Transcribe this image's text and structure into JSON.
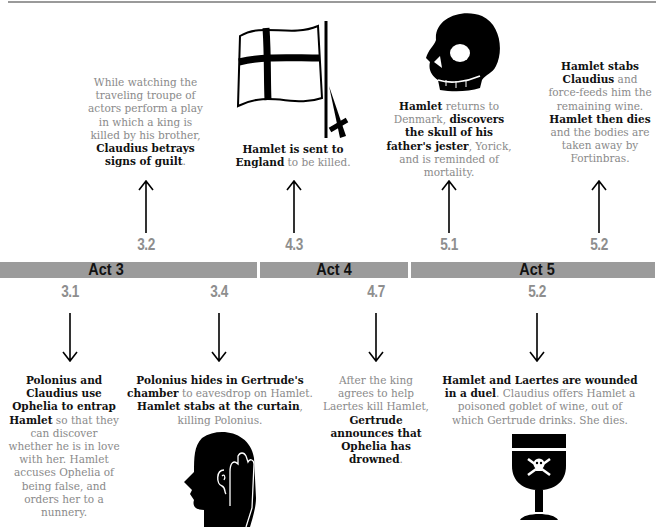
{
  "acts": [
    {
      "label": "Act 3"
    },
    {
      "label": "Act 4"
    },
    {
      "label": "Act 5"
    }
  ],
  "colors": {
    "bar": "#9b9b9b",
    "scene_label": "#8e8e8e",
    "text_regular": "#8a8a8a",
    "text_bold": "#111111"
  },
  "above_events": [
    {
      "scene": "3.2",
      "icon": "none",
      "parts": [
        {
          "t": "While watching the traveling troupe of actors perform a play in which a king is killed by his brother, ",
          "bold": false
        },
        {
          "t": "Claudius betrays signs of guilt",
          "bold": true
        },
        {
          "t": ".",
          "bold": false
        }
      ]
    },
    {
      "scene": "4.3",
      "icon": "flag-and-dagger-icon",
      "parts": [
        {
          "t": "Hamlet is sent to England",
          "bold": true
        },
        {
          "t": " to be killed.",
          "bold": false
        }
      ]
    },
    {
      "scene": "5.1",
      "icon": "skull-icon",
      "parts": [
        {
          "t": "Hamlet",
          "bold": true
        },
        {
          "t": " returns to Denmark, ",
          "bold": false
        },
        {
          "t": "discovers the skull of his father's jester",
          "bold": true
        },
        {
          "t": ", Yorick, and is reminded of mortality.",
          "bold": false
        }
      ]
    },
    {
      "scene": "5.2",
      "icon": "none",
      "parts": [
        {
          "t": "Hamlet stabs Claudius",
          "bold": true
        },
        {
          "t": " and force-feeds him the remaining wine. ",
          "bold": false
        },
        {
          "t": "Hamlet then dies",
          "bold": true
        },
        {
          "t": " and the bodies are taken away by Fortinbras.",
          "bold": false
        }
      ]
    }
  ],
  "below_events": [
    {
      "scene": "3.1",
      "icon": "none",
      "parts": [
        {
          "t": "Polonius and Claudius use Ophelia to entrap Hamlet",
          "bold": true
        },
        {
          "t": " so that they can discover whether he is in love with her. Hamlet accuses Ophelia of being false, and orders her to a nunnery.",
          "bold": false
        }
      ]
    },
    {
      "scene": "3.4",
      "icon": "eavesdropping-head-icon",
      "parts": [
        {
          "t": "Polonius hides in Gertrude's chamber",
          "bold": true
        },
        {
          "t": " to eavesdrop on Hamlet. ",
          "bold": false
        },
        {
          "t": "Hamlet stabs at the curtain",
          "bold": true
        },
        {
          "t": ", killing Polonius.",
          "bold": false
        }
      ]
    },
    {
      "scene": "4.7",
      "icon": "none",
      "parts": [
        {
          "t": "After the king agrees to help Laertes kill Hamlet, ",
          "bold": false
        },
        {
          "t": "Gertrude announces that Ophelia has drowned",
          "bold": true
        },
        {
          "t": ".",
          "bold": false
        }
      ]
    },
    {
      "scene": "5.2",
      "icon": "poisoned-goblet-icon",
      "parts": [
        {
          "t": "Hamlet and Laertes are wounded in a duel",
          "bold": true
        },
        {
          "t": ". Claudius offers Hamlet a poisoned goblet of wine, out of which Gertrude drinks. She dies.",
          "bold": false
        }
      ]
    }
  ]
}
